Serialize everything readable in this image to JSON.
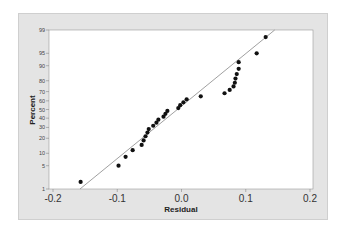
{
  "chart_data": {
    "type": "scatter",
    "subtype": "normal-probability-plot",
    "title": "",
    "xlabel": "Residual",
    "ylabel": "Percent",
    "xlim": [
      -0.2,
      0.2
    ],
    "ylim": [
      1,
      99
    ],
    "x_ticks": [
      "-0.2",
      "-0.1",
      "0.0",
      "0.1",
      "0.2"
    ],
    "y_ticks": [
      "1",
      "5",
      "10",
      "20",
      "30",
      "40",
      "50",
      "60",
      "70",
      "80",
      "90",
      "95",
      "99"
    ],
    "grid": false,
    "legend": null,
    "fit_line": {
      "from": [
        -0.158,
        1
      ],
      "to": [
        0.145,
        99
      ]
    },
    "series": [
      {
        "name": "Residuals",
        "x": [
          -0.157,
          -0.098,
          -0.087,
          -0.076,
          -0.062,
          -0.059,
          -0.056,
          -0.053,
          -0.051,
          -0.044,
          -0.039,
          -0.036,
          -0.028,
          -0.025,
          -0.022,
          -0.005,
          -0.002,
          0.003,
          0.008,
          0.03,
          0.067,
          0.075,
          0.081,
          0.083,
          0.084,
          0.086,
          0.089,
          0.089,
          0.117,
          0.131
        ],
        "y": [
          1.7,
          5.0,
          8.3,
          11.7,
          15.0,
          18.3,
          21.7,
          25.0,
          28.3,
          31.7,
          35.0,
          38.3,
          41.7,
          45.0,
          48.3,
          51.7,
          55.0,
          58.3,
          61.7,
          65.0,
          68.3,
          71.7,
          75.0,
          78.3,
          81.7,
          85.0,
          88.3,
          91.7,
          95.0,
          98.3
        ]
      }
    ]
  },
  "colors": {
    "frame": "#e4e4e4",
    "plot_bg": "#ffffff",
    "points": "#111111",
    "fit_line": "#888888"
  }
}
